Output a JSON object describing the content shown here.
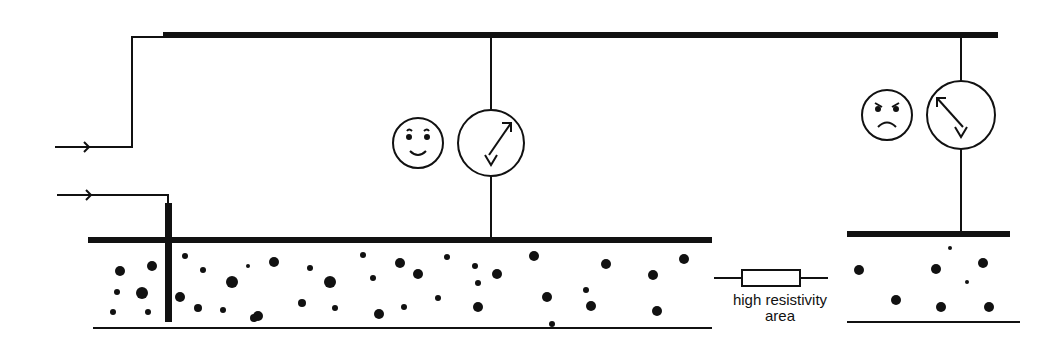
{
  "diagram": {
    "label_line1": "high resistivity",
    "label_line2": "area",
    "colors": {
      "ink": "#111111",
      "background": "#ffffff"
    },
    "top_rail": {
      "x1": 163,
      "x2": 998,
      "y": 35,
      "width": 6
    },
    "left_layer": {
      "x1": 88,
      "x2": 712,
      "top": 240,
      "bottom": 328
    },
    "right_layer": {
      "x1": 847,
      "x2": 1010,
      "top": 234,
      "bottom": 322
    },
    "probe": {
      "x": 168,
      "y1": 193,
      "y2": 322
    },
    "meters": [
      {
        "id": "meter-left",
        "cx": 491,
        "cy": 143,
        "r": 33,
        "needle": "right",
        "face": "happy",
        "face_cx": 418,
        "face_cy": 143
      },
      {
        "id": "meter-right",
        "cx": 961,
        "cy": 115,
        "r": 34,
        "needle": "left",
        "face": "angry",
        "face_cx": 887,
        "face_cy": 115
      }
    ],
    "resistor": {
      "x": 742,
      "y": 270,
      "w": 58,
      "h": 16
    }
  },
  "dots_left": [
    [
      120,
      271,
      5
    ],
    [
      152,
      266,
      5
    ],
    [
      117,
      292,
      3
    ],
    [
      142,
      293,
      6
    ],
    [
      113,
      312,
      3
    ],
    [
      148,
      312,
      3
    ],
    [
      185,
      256,
      3
    ],
    [
      203,
      270,
      3
    ],
    [
      180,
      297,
      5
    ],
    [
      232,
      282,
      6
    ],
    [
      198,
      308,
      4
    ],
    [
      223,
      310,
      3
    ],
    [
      248,
      266,
      2
    ],
    [
      274,
      262,
      5
    ],
    [
      310,
      268,
      3
    ],
    [
      330,
      282,
      6
    ],
    [
      335,
      308,
      3
    ],
    [
      258,
      316,
      5
    ],
    [
      363,
      255,
      3
    ],
    [
      400,
      263,
      5
    ],
    [
      418,
      274,
      5
    ],
    [
      447,
      257,
      3
    ],
    [
      438,
      298,
      3
    ],
    [
      475,
      266,
      3
    ],
    [
      478,
      283,
      3
    ],
    [
      478,
      307,
      5
    ],
    [
      497,
      274,
      5
    ],
    [
      534,
      256,
      5
    ],
    [
      552,
      324,
      3
    ],
    [
      547,
      297,
      5
    ],
    [
      586,
      290,
      3
    ],
    [
      591,
      306,
      5
    ],
    [
      606,
      264,
      5
    ],
    [
      653,
      275,
      5
    ],
    [
      657,
      311,
      5
    ],
    [
      684,
      259,
      5
    ],
    [
      302,
      303,
      4
    ],
    [
      254,
      318,
      4
    ],
    [
      379,
      314,
      5
    ],
    [
      404,
      307,
      3
    ],
    [
      373,
      278,
      3
    ]
  ],
  "dots_right": [
    [
      859,
      270,
      5
    ],
    [
      936,
      269,
      5
    ],
    [
      983,
      263,
      5
    ],
    [
      896,
      300,
      5
    ],
    [
      941,
      307,
      5
    ],
    [
      989,
      307,
      5
    ],
    [
      950,
      248,
      2
    ],
    [
      967,
      282,
      2
    ]
  ]
}
